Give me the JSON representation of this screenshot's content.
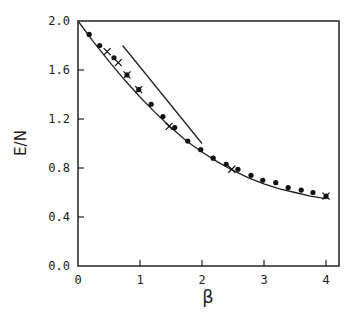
{
  "chart_data": {
    "type": "scatter",
    "title": "",
    "xlabel": "β",
    "ylabel": "E/N",
    "xlim": [
      0,
      4.07
    ],
    "ylim": [
      0.0,
      2.0
    ],
    "xticks": [
      0,
      1,
      2,
      3,
      4
    ],
    "xtick_labels": [
      "0",
      "1",
      "2",
      "3",
      "4"
    ],
    "yticks": [
      0.0,
      0.4,
      0.8,
      1.2,
      1.6,
      2.0
    ],
    "ytick_labels": [
      "0.0",
      "0.4",
      "0.8",
      "1.2",
      "1.6",
      "2.0"
    ],
    "grid": false,
    "legend": null,
    "series": [
      {
        "name": "dots",
        "marker": "filled-circle",
        "x": [
          0.18,
          0.35,
          0.58,
          0.79,
          0.98,
          1.18,
          1.37,
          1.56,
          1.77,
          1.98,
          2.18,
          2.39,
          2.58,
          2.79,
          2.98,
          3.19,
          3.39,
          3.6,
          3.79,
          4.0
        ],
        "y": [
          1.89,
          1.8,
          1.7,
          1.56,
          1.44,
          1.32,
          1.22,
          1.13,
          1.02,
          0.95,
          0.88,
          0.83,
          0.79,
          0.74,
          0.7,
          0.68,
          0.64,
          0.62,
          0.6,
          0.57
        ]
      },
      {
        "name": "crosses",
        "marker": "plus",
        "x": [
          0.47,
          0.65,
          0.79,
          0.98,
          1.47,
          2.48,
          4.0
        ],
        "y": [
          1.75,
          1.66,
          1.56,
          1.44,
          1.14,
          0.79,
          0.57
        ]
      },
      {
        "name": "curve",
        "type": "line",
        "x": [
          0.0,
          0.25,
          0.5,
          0.75,
          1.0,
          1.25,
          1.5,
          1.75,
          2.0,
          2.25,
          2.5,
          2.75,
          3.0,
          3.25,
          3.5,
          3.75,
          4.0
        ],
        "y": [
          2.0,
          1.83,
          1.67,
          1.52,
          1.38,
          1.25,
          1.13,
          1.02,
          0.93,
          0.85,
          0.78,
          0.72,
          0.67,
          0.63,
          0.6,
          0.57,
          0.55
        ]
      },
      {
        "name": "straight-line",
        "type": "line",
        "x": [
          0.72,
          2.0
        ],
        "y": [
          1.8,
          1.0
        ]
      }
    ]
  }
}
